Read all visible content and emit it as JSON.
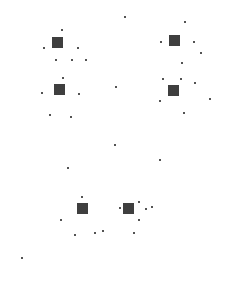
{
  "canvas": {
    "width": 228,
    "height": 302,
    "background": "#ffffff",
    "ink": "#1a1a1a"
  },
  "clusters": [
    {
      "x": 57,
      "y": 42
    },
    {
      "x": 174,
      "y": 40
    },
    {
      "x": 59,
      "y": 89
    },
    {
      "x": 173,
      "y": 90
    },
    {
      "x": 82,
      "y": 208
    },
    {
      "x": 128,
      "y": 208
    }
  ],
  "dots": [
    {
      "x": 125,
      "y": 17
    },
    {
      "x": 185,
      "y": 22
    },
    {
      "x": 62,
      "y": 30
    },
    {
      "x": 44,
      "y": 48
    },
    {
      "x": 78,
      "y": 48
    },
    {
      "x": 161,
      "y": 42
    },
    {
      "x": 194,
      "y": 42
    },
    {
      "x": 56,
      "y": 60
    },
    {
      "x": 72,
      "y": 60
    },
    {
      "x": 86,
      "y": 60
    },
    {
      "x": 201,
      "y": 53
    },
    {
      "x": 63,
      "y": 78
    },
    {
      "x": 182,
      "y": 63
    },
    {
      "x": 42,
      "y": 93
    },
    {
      "x": 79,
      "y": 94
    },
    {
      "x": 163,
      "y": 79
    },
    {
      "x": 181,
      "y": 79
    },
    {
      "x": 195,
      "y": 83
    },
    {
      "x": 116,
      "y": 87
    },
    {
      "x": 160,
      "y": 101
    },
    {
      "x": 210,
      "y": 99
    },
    {
      "x": 71,
      "y": 117
    },
    {
      "x": 184,
      "y": 113
    },
    {
      "x": 50,
      "y": 115
    },
    {
      "x": 115,
      "y": 145
    },
    {
      "x": 160,
      "y": 160
    },
    {
      "x": 68,
      "y": 168
    },
    {
      "x": 82,
      "y": 197
    },
    {
      "x": 146,
      "y": 209
    },
    {
      "x": 120,
      "y": 208
    },
    {
      "x": 95,
      "y": 233
    },
    {
      "x": 61,
      "y": 220
    },
    {
      "x": 75,
      "y": 235
    },
    {
      "x": 103,
      "y": 231
    },
    {
      "x": 139,
      "y": 202
    },
    {
      "x": 152,
      "y": 207
    },
    {
      "x": 139,
      "y": 220
    },
    {
      "x": 134,
      "y": 233
    },
    {
      "x": 22,
      "y": 258
    }
  ]
}
